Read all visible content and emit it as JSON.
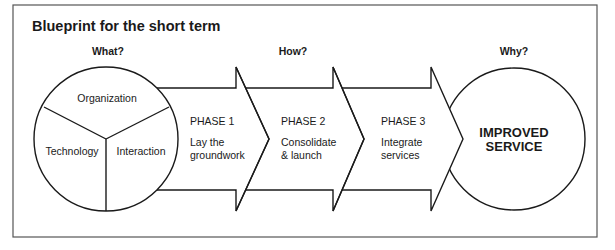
{
  "title": "Blueprint for the short term",
  "columns": {
    "what": "What?",
    "how": "How?",
    "why": "Why?"
  },
  "what_circle": {
    "segments": [
      {
        "label": "Organization"
      },
      {
        "label": "Technology"
      },
      {
        "label": "Interaction"
      }
    ]
  },
  "phases": [
    {
      "label": "PHASE 1",
      "desc_line1": "Lay the",
      "desc_line2": "groundwork"
    },
    {
      "label": "PHASE 2",
      "desc_line1": "Consolidate",
      "desc_line2": "& launch"
    },
    {
      "label": "PHASE 3",
      "desc_line1": "Integrate",
      "desc_line2": "services"
    }
  ],
  "goal_circle": {
    "line1": "IMPROVED",
    "line2": "SERVICE"
  },
  "colors": {
    "ink": "#1a1a1a",
    "frame": "#555555",
    "background": "#ffffff"
  }
}
